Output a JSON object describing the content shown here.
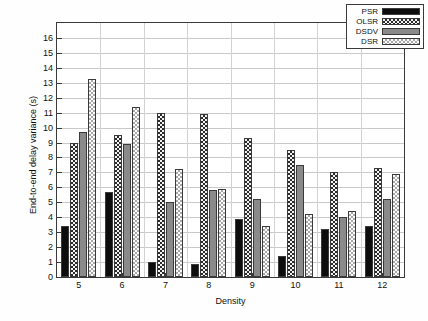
{
  "chart_data": {
    "type": "bar",
    "title": "",
    "xlabel": "Density",
    "ylabel": "End-to-end delay variance (s)",
    "categories": [
      "5",
      "6",
      "7",
      "8",
      "9",
      "10",
      "11",
      "12"
    ],
    "ylim": [
      0,
      17
    ],
    "yticks": [
      "0",
      "1",
      "2",
      "3",
      "4",
      "5",
      "6",
      "7",
      "8",
      "9",
      "10",
      "11",
      "12",
      "13",
      "14",
      "15",
      "16"
    ],
    "grid": true,
    "legend_position": "top-right",
    "series": [
      {
        "name": "PSR",
        "values": [
          3.4,
          5.7,
          1.0,
          0.9,
          3.9,
          1.4,
          3.2,
          3.4
        ],
        "color": "#0d0d0d",
        "pattern": "solid-black"
      },
      {
        "name": "OLSR",
        "values": [
          9.0,
          9.5,
          11.0,
          10.9,
          9.3,
          8.5,
          7.0,
          7.3
        ],
        "color": "#2b2b2b",
        "pattern": "fine-checker"
      },
      {
        "name": "DSDV",
        "values": [
          9.7,
          8.9,
          5.0,
          5.8,
          5.2,
          7.5,
          4.0,
          5.2
        ],
        "color": "#8a8a8a",
        "pattern": "solid-gray"
      },
      {
        "name": "DSR",
        "values": [
          13.25,
          11.4,
          7.2,
          5.9,
          3.4,
          4.2,
          4.4,
          6.9
        ],
        "color": "#a8a8a8",
        "pattern": "light-checker"
      }
    ]
  },
  "legend": {
    "items": [
      {
        "label": "PSR"
      },
      {
        "label": "OLSR"
      },
      {
        "label": "DSDV"
      },
      {
        "label": "DSR"
      }
    ]
  }
}
